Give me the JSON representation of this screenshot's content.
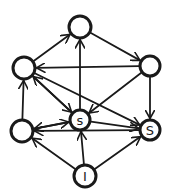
{
  "diagram": {
    "type": "directed-graph",
    "style": "hand-drawn",
    "stroke_color": "#1a1a1a",
    "background": "#ffffff",
    "nodes": [
      {
        "id": "top",
        "label": "",
        "x": 80,
        "y": 27,
        "r": 11
      },
      {
        "id": "upper-left",
        "label": "",
        "x": 24,
        "y": 68,
        "r": 11
      },
      {
        "id": "upper-right",
        "label": "",
        "x": 150,
        "y": 66,
        "r": 10
      },
      {
        "id": "lower-left",
        "label": "",
        "x": 22,
        "y": 131,
        "r": 11
      },
      {
        "id": "center-s",
        "label": "s",
        "x": 80,
        "y": 120,
        "r": 10
      },
      {
        "id": "right-s",
        "label": "S",
        "x": 150,
        "y": 130,
        "r": 10
      },
      {
        "id": "bottom-i",
        "label": "I",
        "x": 85,
        "y": 176,
        "r": 11
      }
    ],
    "edges": [
      {
        "from": "upper-left",
        "to": "top"
      },
      {
        "from": "center-s",
        "to": "top"
      },
      {
        "from": "top",
        "to": "upper-right"
      },
      {
        "from": "upper-right",
        "to": "upper-left"
      },
      {
        "from": "lower-left",
        "to": "upper-left"
      },
      {
        "from": "center-s",
        "to": "upper-left"
      },
      {
        "from": "upper-left",
        "to": "right-s"
      },
      {
        "from": "upper-right",
        "to": "center-s"
      },
      {
        "from": "upper-right",
        "to": "right-s"
      },
      {
        "from": "upper-left",
        "to": "center-s"
      },
      {
        "from": "lower-left",
        "to": "center-s"
      },
      {
        "from": "center-s",
        "to": "lower-left"
      },
      {
        "from": "center-s",
        "to": "right-s"
      },
      {
        "from": "right-s",
        "to": "lower-left"
      },
      {
        "from": "bottom-i",
        "to": "lower-left"
      },
      {
        "from": "bottom-i",
        "to": "center-s"
      },
      {
        "from": "bottom-i",
        "to": "right-s"
      }
    ]
  }
}
